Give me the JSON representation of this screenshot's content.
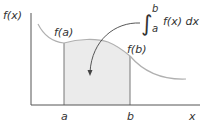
{
  "diagram": {
    "labels": {
      "y_axis": "f(x)",
      "x_axis": "x",
      "a": "a",
      "b": "b",
      "fa": "f(a)",
      "fb": "f(b)",
      "integral_upper": "b",
      "integral_lower": "a",
      "integrand": "f(x) dx",
      "integral_sign": "∫"
    },
    "colors": {
      "axis": "#555555",
      "curve": "#b0b0b0",
      "shade": "#ebebeb",
      "shade_edge": "#777777",
      "text": "#333333",
      "arrow": "#444444"
    }
  }
}
